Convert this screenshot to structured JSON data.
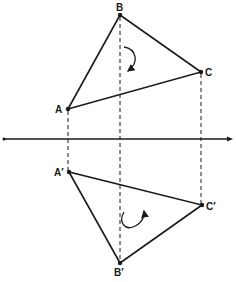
{
  "diagram": {
    "type": "orthographic-projection",
    "colors": {
      "ink": "#1a1a1a",
      "background": "#ffffff"
    },
    "upper_view": {
      "points": [
        {
          "id": "A",
          "label": "A",
          "x": 68,
          "y": 109
        },
        {
          "id": "B",
          "label": "B",
          "x": 120,
          "y": 15
        },
        {
          "id": "C",
          "label": "C",
          "x": 201,
          "y": 72
        }
      ],
      "rotation": "clockwise"
    },
    "lower_view": {
      "points": [
        {
          "id": "A'",
          "label": "A′",
          "x": 69,
          "y": 172
        },
        {
          "id": "B'",
          "label": "B′",
          "x": 120,
          "y": 263
        },
        {
          "id": "C'",
          "label": "C′",
          "x": 202,
          "y": 205
        }
      ],
      "rotation": "counterclockwise"
    },
    "reference_line": {
      "y": 139,
      "x_start": 3,
      "x_end": 233
    }
  }
}
